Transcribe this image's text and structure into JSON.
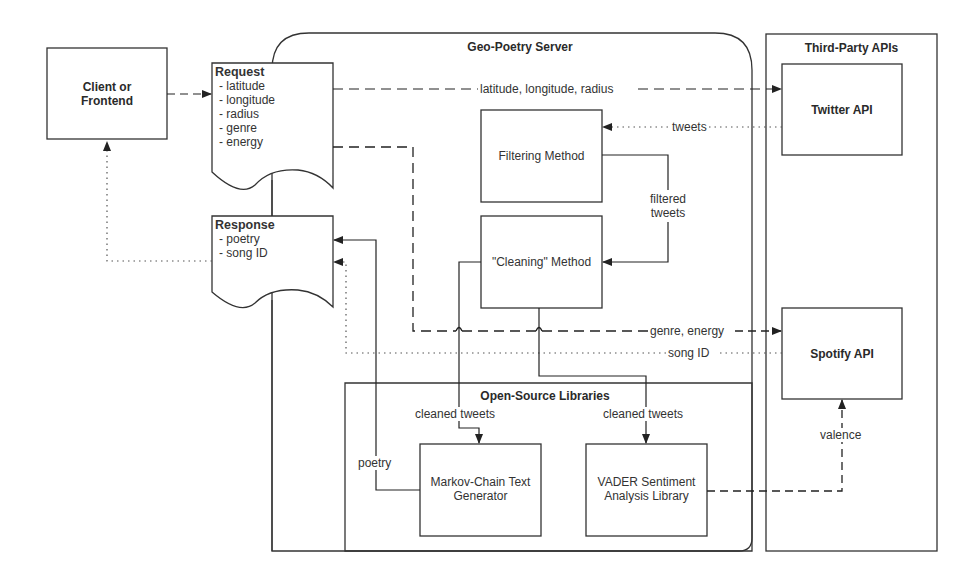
{
  "client": {
    "label_line1": "Client or",
    "label_line2": "Frontend"
  },
  "request": {
    "title": "Request",
    "items": [
      "- latitude",
      "- longitude",
      "- radius",
      "- genre",
      "- energy"
    ]
  },
  "response": {
    "title": "Response",
    "items": [
      "- poetry",
      "- song ID"
    ]
  },
  "server": {
    "title": "Geo-Poetry Server",
    "filtering": "Filtering Method",
    "cleaning": "\"Cleaning\" Method",
    "filtered_tweets_line1": "filtered",
    "filtered_tweets_line2": "tweets"
  },
  "libraries": {
    "title": "Open-Source Libraries",
    "markov_line1": "Markov-Chain Text",
    "markov_line2": "Generator",
    "vader_line1": "VADER Sentiment",
    "vader_line2": "Analysis Library"
  },
  "third_party": {
    "title": "Third-Party APIs",
    "twitter": "Twitter API",
    "spotify": "Spotify API"
  },
  "edges": {
    "lat_lon_radius": "latitude, longitude, radius",
    "tweets": "tweets",
    "genre_energy": "genre, energy",
    "song_id": "song ID",
    "cleaned_tweets_markov": "cleaned tweets",
    "cleaned_tweets_vader": "cleaned tweets",
    "poetry": "poetry",
    "valence": "valence"
  }
}
